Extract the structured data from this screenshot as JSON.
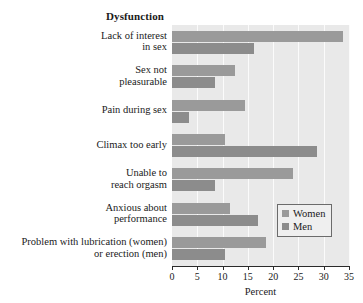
{
  "chart_data": {
    "type": "bar",
    "orientation": "horizontal",
    "title": "Dysfunction",
    "xlabel": "Percent",
    "ylabel": "",
    "xlim": [
      0,
      35
    ],
    "xticks": [
      0,
      5,
      10,
      15,
      20,
      25,
      30,
      35
    ],
    "grid": true,
    "grid_axis": "x",
    "legend_position": "center-right",
    "categories": [
      "Lack of interest in sex",
      "Sex not pleasurable",
      "Pain during sex",
      "Climax too early",
      "Unable to reach orgasm",
      "Anxious about performance",
      "Problem with lubrication (women) or erection (men)"
    ],
    "category_label_lines": [
      [
        "Lack of interest",
        "in sex"
      ],
      [
        "Sex not",
        "pleasurable"
      ],
      [
        "Pain during sex"
      ],
      [
        "Climax too early"
      ],
      [
        "Unable to",
        "reach orgasm"
      ],
      [
        "Anxious about",
        "performance"
      ],
      [
        "Problem with lubrication (women)",
        "or erection (men)"
      ]
    ],
    "series": [
      {
        "name": "Women",
        "color": "#9a9a9a",
        "values": [
          33.8,
          12.5,
          14.5,
          10.5,
          24.0,
          11.5,
          18.5
        ]
      },
      {
        "name": "Men",
        "color": "#8c8c8c",
        "values": [
          16.2,
          8.5,
          3.4,
          28.7,
          8.5,
          17.0,
          10.5
        ]
      }
    ]
  },
  "legend": {
    "entries": [
      {
        "label": "Women",
        "color": "#9a9a9a"
      },
      {
        "label": "Men",
        "color": "#8c8c8c"
      }
    ]
  },
  "axis": {
    "x_title": "Percent",
    "tick_labels": [
      "0",
      "5",
      "10",
      "15",
      "20",
      "25",
      "30",
      "35"
    ]
  },
  "colors": {
    "plot_background": "#e9e9e9",
    "gridline": "#fbfbfb",
    "axis": "#2b2b2b",
    "text": "#1a1a1a"
  }
}
